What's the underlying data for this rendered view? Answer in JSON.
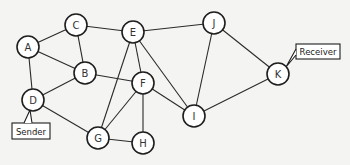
{
  "diagram": {
    "type": "network-graph",
    "node_radius": 11,
    "nodes": [
      {
        "id": "A",
        "label": "A",
        "x": 28,
        "y": 47
      },
      {
        "id": "B",
        "label": "B",
        "x": 85,
        "y": 73
      },
      {
        "id": "C",
        "label": "C",
        "x": 76,
        "y": 25
      },
      {
        "id": "D",
        "label": "D",
        "x": 33,
        "y": 100
      },
      {
        "id": "E",
        "label": "E",
        "x": 133,
        "y": 32
      },
      {
        "id": "F",
        "label": "F",
        "x": 143,
        "y": 83
      },
      {
        "id": "G",
        "label": "G",
        "x": 98,
        "y": 138
      },
      {
        "id": "H",
        "label": "H",
        "x": 143,
        "y": 143
      },
      {
        "id": "I",
        "label": "I",
        "x": 194,
        "y": 116
      },
      {
        "id": "J",
        "label": "J",
        "x": 214,
        "y": 23
      },
      {
        "id": "K",
        "label": "K",
        "x": 278,
        "y": 74
      }
    ],
    "edges": [
      [
        "A",
        "C"
      ],
      [
        "A",
        "B"
      ],
      [
        "A",
        "D"
      ],
      [
        "C",
        "B"
      ],
      [
        "C",
        "E"
      ],
      [
        "B",
        "D"
      ],
      [
        "B",
        "F"
      ],
      [
        "D",
        "G"
      ],
      [
        "E",
        "J"
      ],
      [
        "E",
        "F"
      ],
      [
        "E",
        "G"
      ],
      [
        "E",
        "I"
      ],
      [
        "F",
        "G"
      ],
      [
        "F",
        "H"
      ],
      [
        "F",
        "I"
      ],
      [
        "G",
        "H"
      ],
      [
        "I",
        "J"
      ],
      [
        "I",
        "K"
      ],
      [
        "J",
        "K"
      ]
    ],
    "callouts": [
      {
        "id": "sender",
        "label": "Sender",
        "target": "D",
        "box": {
          "x": 12,
          "y": 123,
          "w": 38,
          "h": 16
        },
        "pointer": [
          [
            24,
            123
          ],
          [
            30,
            110
          ],
          [
            32,
            123
          ]
        ]
      },
      {
        "id": "receiver",
        "label": "Receiver",
        "target": "K",
        "box": {
          "x": 296,
          "y": 44,
          "w": 44,
          "h": 15
        },
        "pointer": [
          [
            296,
            49
          ],
          [
            286,
            67
          ],
          [
            296,
            55
          ]
        ]
      }
    ]
  }
}
